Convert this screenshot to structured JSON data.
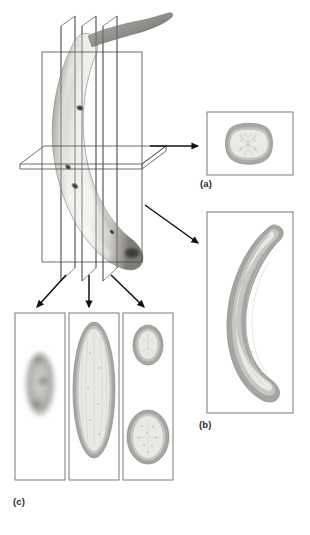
{
  "figure": {
    "background_color": "#ffffff",
    "modality_look": "grayscale photographic/MRI-style rendering",
    "panel_labels": {
      "a": "(a)",
      "b": "(b)",
      "c": "(c)"
    },
    "label_color": "#2b2b2b"
  },
  "colors": {
    "peel_outer": "#9a9a9a",
    "peel_mid": "#b3b3b3",
    "peel_inner_rim": "#c9c9c7",
    "flesh": "#e7e7e3",
    "flesh_shadow": "#d6d6d1",
    "panel_border": "#6b6b6b",
    "plane_line": "#4a4a4a",
    "arrow": "#111111",
    "banana_light": "#f2f1ee",
    "banana_mid": "#c8c6c1",
    "banana_dark": "#6e6c68",
    "banana_spot": "#2a2927"
  },
  "scene": {
    "name": "3D banana with cut planes",
    "planes": [
      {
        "id": "sagittal-1",
        "label": "sagittal plane 1",
        "type": "vertical"
      },
      {
        "id": "sagittal-2",
        "label": "sagittal plane 2",
        "type": "vertical"
      },
      {
        "id": "sagittal-3",
        "label": "sagittal plane 3",
        "type": "vertical"
      },
      {
        "id": "coronal",
        "label": "coronal plane",
        "type": "vertical-frontal"
      },
      {
        "id": "axial",
        "label": "axial plane",
        "type": "horizontal"
      }
    ],
    "arrows": [
      {
        "id": "arrow-to-a",
        "from": "axial-plane",
        "to": "panel-a",
        "direction": "right"
      },
      {
        "id": "arrow-to-b",
        "from": "coronal-plane",
        "to": "panel-b",
        "direction": "down-right"
      },
      {
        "id": "arrow-to-c1",
        "from": "sagittal-plane-1",
        "to": "panel-c1",
        "direction": "down-left"
      },
      {
        "id": "arrow-to-c2",
        "from": "sagittal-plane-2",
        "to": "panel-c2",
        "direction": "down"
      },
      {
        "id": "arrow-to-c3",
        "from": "sagittal-plane-3",
        "to": "panel-c3",
        "direction": "down-right"
      }
    ]
  },
  "panels": {
    "a": {
      "label": "(a)",
      "caption": "(a)",
      "description": "axial cross-section of banana: rounded-square peel ring with pale striated flesh core",
      "section_type": "axial",
      "shapes": 1
    },
    "b": {
      "label": "(b)",
      "caption": "(b)",
      "description": "coronal longitudinal section: crescent-shaped banana with gray peel and pale flesh",
      "section_type": "coronal",
      "shapes": 1
    },
    "c": {
      "label": "(c)",
      "caption": "(c)",
      "description": "three sagittal slices at increasing distance from midline",
      "section_type": "sagittal",
      "sub_panels": [
        {
          "id": "c1",
          "description": "tangential slice: small blurred gray ellipse through peel surface",
          "shapes": 1
        },
        {
          "id": "c2",
          "description": "mid slice: tall elongated ellipse with peel ring and striated flesh",
          "shapes": 1
        },
        {
          "id": "c3",
          "description": "off-axis slice: two separate oval cross-sections, small upper and larger lower",
          "shapes": 2
        }
      ]
    }
  }
}
